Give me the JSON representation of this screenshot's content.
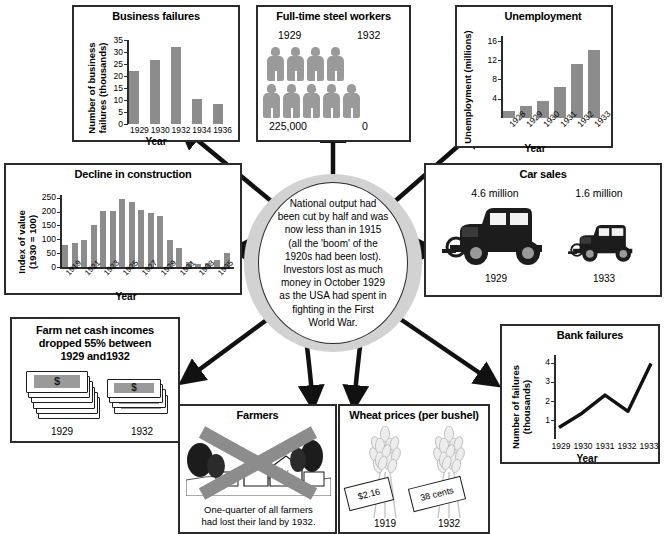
{
  "central": {
    "text": "National output had\nbeen cut by half and was\nnow less than in 1915\n(all the 'boom' of the\n1920s had been lost).\nInvestors lost as much\nmoney in October 1929\nas the USA had spent in\nfighting in the First\nWorld War."
  },
  "colors": {
    "bar": "#8c8c8c",
    "pictogram": "#9a9a9a",
    "border": "#2b2b2b",
    "oval_ring": "#d2d2d2"
  },
  "panels": {
    "business_failures": {
      "title": "Business failures",
      "ylabel": "Number of business\nfailures (thousands)",
      "xlabel": "Year"
    },
    "steel_workers": {
      "title": "Full-time steel workers",
      "year_left": "1929",
      "year_right": "1932",
      "value_left": "225,000",
      "value_right": "0",
      "icons_left": 9,
      "icons_right": 0
    },
    "unemployment": {
      "title": "Unemployment",
      "ylabel": "Unemployment (millions)",
      "xlabel": "Year"
    },
    "construction": {
      "title": "Decline in construction",
      "ylabel": "Index of value\n(1930 = 100)",
      "xlabel": "Year"
    },
    "car_sales": {
      "title": "Car sales",
      "value_left": "4.6 million",
      "value_right": "1.6 million",
      "year_left": "1929",
      "year_right": "1933"
    },
    "farm_incomes": {
      "title": "Farm net cash incomes\ndropped 55% between\n1929 and1932",
      "year_left": "1929",
      "year_right": "1932",
      "currency_glyph": "$"
    },
    "farmers": {
      "title": "Farmers",
      "caption": "One-quarter of all farmers\nhad lost their land by 1932."
    },
    "wheat_prices": {
      "title": "Wheat prices (per bushel)",
      "tag_left": "$2.16",
      "tag_right": "38 cents",
      "year_left": "1919",
      "year_right": "1932"
    },
    "bank_failures": {
      "title": "Bank failures",
      "ylabel": "Number of failures\n(thousands)",
      "xlabel": "Year"
    }
  },
  "chart_data": [
    {
      "id": "business_failures",
      "type": "bar",
      "title": "Business failures",
      "xlabel": "Year",
      "ylabel": "Number of business failures (thousands)",
      "categories": [
        "1929",
        "1930",
        "1932",
        "1934",
        "1936"
      ],
      "values": [
        22,
        26.5,
        32,
        10.5,
        8.5
      ],
      "yticks": [
        0,
        5,
        10,
        15,
        20,
        25,
        30,
        35
      ],
      "ylim": [
        0,
        35
      ],
      "grid": false,
      "legend": "none"
    },
    {
      "id": "unemployment",
      "type": "bar",
      "title": "Unemployment",
      "xlabel": "Year",
      "ylabel": "Unemployment (millions)",
      "categories": [
        "1928",
        "1929",
        "1930",
        "1931",
        "1932",
        "1933"
      ],
      "values": [
        1.5,
        2.5,
        3.6,
        6.5,
        11.3,
        14.0
      ],
      "yticks": [
        4,
        8,
        12,
        16
      ],
      "ylim": [
        0,
        17
      ],
      "grid": false,
      "legend": "none"
    },
    {
      "id": "construction",
      "type": "bar",
      "title": "Decline in construction",
      "xlabel": "Year",
      "ylabel": "Index of value (1930 = 100)",
      "categories": [
        "1919",
        "1920",
        "1921",
        "1922",
        "1923",
        "1924",
        "1925",
        "1926",
        "1927",
        "1928",
        "1929",
        "1930",
        "1931",
        "1932",
        "1933",
        "1934",
        "1935",
        "1936"
      ],
      "values": [
        78,
        85,
        98,
        152,
        201,
        203,
        246,
        233,
        205,
        195,
        183,
        98,
        67,
        17,
        12,
        16,
        25,
        50
      ],
      "tick_labels": [
        "1919",
        "",
        "1921",
        "",
        "1923",
        "",
        "1925",
        "",
        "1927",
        "",
        "1929",
        "",
        "1931",
        "",
        "1933",
        "",
        "1935",
        ""
      ],
      "yticks": [
        0,
        50,
        100,
        150,
        200,
        250
      ],
      "ylim": [
        0,
        260
      ],
      "grid": false,
      "legend": "none"
    },
    {
      "id": "bank_failures",
      "type": "line",
      "title": "Bank failures",
      "xlabel": "Year",
      "ylabel": "Number of failures (thousands)",
      "categories": [
        "1929",
        "1930",
        "1931",
        "1932",
        "1933"
      ],
      "values": [
        0.6,
        1.35,
        2.3,
        1.45,
        3.95
      ],
      "yticks": [
        1,
        2,
        3,
        4
      ],
      "ylim": [
        0,
        4.4
      ],
      "grid": false,
      "legend": "none"
    },
    {
      "id": "steel_workers",
      "type": "pictogram",
      "title": "Full-time steel workers",
      "categories": [
        "1929",
        "1932"
      ],
      "values": [
        225000,
        0
      ],
      "value_labels": [
        "225,000",
        "0"
      ],
      "icon_counts": [
        9,
        0
      ]
    },
    {
      "id": "car_sales",
      "type": "pictogram",
      "title": "Car sales",
      "categories": [
        "1929",
        "1933"
      ],
      "values": [
        4.6,
        1.6
      ],
      "value_labels": [
        "4.6 million",
        "1.6 million"
      ],
      "unit": "million"
    },
    {
      "id": "wheat_prices",
      "type": "pictogram",
      "title": "Wheat prices (per bushel)",
      "categories": [
        "1919",
        "1932"
      ],
      "values": [
        2.16,
        0.38
      ],
      "value_labels": [
        "$2.16",
        "38 cents"
      ]
    },
    {
      "id": "farm_incomes",
      "type": "pictogram",
      "title": "Farm net cash incomes dropped 55% between 1929 and1932",
      "categories": [
        "1929",
        "1932"
      ],
      "values": [
        100,
        45
      ]
    }
  ]
}
